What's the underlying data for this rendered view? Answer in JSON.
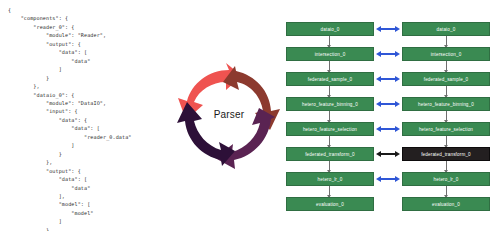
{
  "config": {
    "title": "pipeline-config-json",
    "code": "{\n    \"components\": {\n        \"reader_0\": {\n            \"module\": \"Reader\",\n            \"output\": {\n                \"data\": [\n                    \"data\"\n                ]\n            }\n        },\n        \"dataio_0\": {\n            \"module\": \"DataIO\",\n            \"input\": {\n                \"data\": {\n                    \"data\": [\n                        \"reader_0.data\"\n                    ]\n                }\n            },\n            \"output\": {\n                \"data\": [\n                    \"data\"\n                ],\n                \"model\": [\n                    \"model\"\n                ]\n            }\n        },"
  },
  "parser": {
    "label": "Parser",
    "segment_colors": [
      "#ef5350",
      "#8c3a2e",
      "#5a2352",
      "#2d1038"
    ]
  },
  "dag": {
    "node_color": "#3a8a52",
    "node_border_color": "#2f6e42",
    "highlight_color": "#231f20",
    "arrow_color": "#2f56d6",
    "arrow_highlight_color": "#1a1a1a",
    "connector_color": "#6f6f6f",
    "rows": [
      {
        "left": "dataio_0",
        "right": "dataio_0",
        "link": "bidirectional",
        "link_style": "normal",
        "left_highlight": false,
        "right_highlight": false,
        "flow_down": true
      },
      {
        "left": "intersection_0",
        "right": "intersection_0",
        "link": "bidirectional",
        "link_style": "normal",
        "left_highlight": false,
        "right_highlight": false,
        "flow_down": true
      },
      {
        "left": "federated_sample_0",
        "right": "federated_sample_0",
        "link": "bidirectional",
        "link_style": "normal",
        "left_highlight": false,
        "right_highlight": false,
        "flow_down": true
      },
      {
        "left": "hetero_feature_binning_0",
        "right": "hetero_feature_binning_0",
        "link": "bidirectional",
        "link_style": "normal",
        "left_highlight": false,
        "right_highlight": false,
        "flow_down": true
      },
      {
        "left": "hetero_feature_selection",
        "right": "hetero_feature_selection",
        "link": "bidirectional",
        "link_style": "normal",
        "left_highlight": false,
        "right_highlight": false,
        "flow_down": true
      },
      {
        "left": "federated_transform_0",
        "right": "federated_transform_0",
        "link": "bidirectional",
        "link_style": "highlight",
        "left_highlight": false,
        "right_highlight": true,
        "flow_down": true
      },
      {
        "left": "hetero_lr_0",
        "right": "hetero_lr_0",
        "link": "bidirectional",
        "link_style": "normal",
        "left_highlight": false,
        "right_highlight": false,
        "flow_down": true
      },
      {
        "left": "evaluation_0",
        "right": "evaluation_0",
        "link": "none",
        "link_style": "none",
        "left_highlight": false,
        "right_highlight": false,
        "flow_down": false
      }
    ]
  }
}
